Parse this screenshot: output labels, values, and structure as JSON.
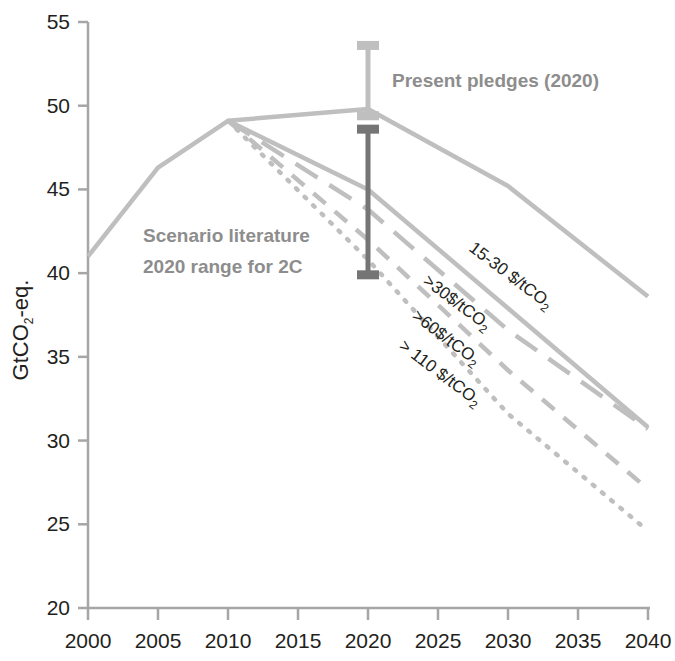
{
  "chart_data": {
    "type": "line",
    "title": "",
    "xlabel": "",
    "ylabel": "GtCO2-eq.",
    "ylabel_main": "GtCO",
    "ylabel_sub": "2",
    "ylabel_tail": "-eq.",
    "xlim": [
      2000,
      2040
    ],
    "ylim": [
      20,
      55
    ],
    "xticks": [
      2000,
      2005,
      2010,
      2015,
      2020,
      2025,
      2030,
      2035,
      2040
    ],
    "yticks": [
      20,
      25,
      30,
      35,
      40,
      45,
      50,
      55
    ],
    "grid": false,
    "legend": "inline-annotations",
    "series": [
      {
        "name": "Historical",
        "style": "solid",
        "color": "#bfbfbf",
        "x": [
          2000,
          2005,
          2010
        ],
        "values": [
          41.0,
          46.3,
          49.1
        ]
      },
      {
        "name": "Present pledges (2020)",
        "style": "solid",
        "color": "#bfbfbf",
        "x": [
          2010,
          2020,
          2030,
          2040
        ],
        "values": [
          49.1,
          49.8,
          45.2,
          38.6
        ]
      },
      {
        "name": "15-30 $/tCO2",
        "style": "solid",
        "color": "#bfbfbf",
        "x": [
          2010,
          2020,
          2030,
          2040
        ],
        "values": [
          49.1,
          45.0,
          37.9,
          30.8
        ]
      },
      {
        "name": ">30$/tCO2",
        "style": "long-dash",
        "color": "#bfbfbf",
        "x": [
          2010,
          2020,
          2030,
          2040
        ],
        "values": [
          49.1,
          43.8,
          36.6,
          30.7
        ]
      },
      {
        "name": ">60$/tCO2",
        "style": "dash",
        "color": "#bfbfbf",
        "x": [
          2010,
          2020,
          2030,
          2040
        ],
        "values": [
          49.1,
          42.0,
          34.2,
          27.1
        ]
      },
      {
        "name": "> 110 $/tCO2",
        "style": "dotted",
        "color": "#bfbfbf",
        "x": [
          2010,
          2020,
          2030,
          2040
        ],
        "values": [
          49.1,
          40.8,
          31.6,
          24.6
        ]
      }
    ],
    "error_bars": [
      {
        "name": "present-pledges-range",
        "x": 2020,
        "low": 49.4,
        "high": 53.6,
        "color": "#bfbfbf"
      },
      {
        "name": "scenario-literature-2c-range",
        "x": 2020,
        "low": 39.9,
        "high": 48.6,
        "color": "#757575"
      }
    ],
    "annotations": [
      {
        "name": "present-pledges",
        "text": "Present pledges (2020)",
        "x_px": 392,
        "y_px": 87,
        "rotation": 0,
        "color": "#8d8d8d"
      },
      {
        "name": "scenario-literature-line1",
        "text": "Scenario literature",
        "x_px": 143,
        "y_px": 242,
        "rotation": 0,
        "color": "#8d8d8d"
      },
      {
        "name": "scenario-literature-line2",
        "text": "2020 range for 2C",
        "x_px": 143,
        "y_px": 273,
        "rotation": 0,
        "color": "#8d8d8d"
      }
    ],
    "curve_labels": [
      {
        "name": "label-15-30",
        "prefix": "15-30 $/tCO",
        "sub": "2",
        "x_px": 468,
        "y_px": 250,
        "rotation": 37
      },
      {
        "name": "label-gt30",
        "prefix": ">30$/tCO",
        "sub": "2",
        "x_px": 422,
        "y_px": 283,
        "rotation": 37
      },
      {
        "name": "label-gt60",
        "prefix": ">60$/tCO",
        "sub": "2",
        "x_px": 411,
        "y_px": 318,
        "rotation": 37
      },
      {
        "name": "label-gt110",
        "prefix": "> 110 $/tCO",
        "sub": "2",
        "x_px": 398,
        "y_px": 348,
        "rotation": 37
      }
    ]
  },
  "axis": {
    "y_tick_labels": [
      "55",
      "50",
      "45",
      "40",
      "35",
      "30",
      "25",
      "20"
    ],
    "x_tick_labels": [
      "2000",
      "2005",
      "2010",
      "2015",
      "2020",
      "2025",
      "2030",
      "2035",
      "2040"
    ]
  },
  "colors": {
    "line_gray": "#bfbfbf",
    "dark_gray": "#757575",
    "text_gray": "#8d8d8d",
    "axis": "#a6a6a6",
    "text_black": "#231f20",
    "background": "#ffffff"
  }
}
